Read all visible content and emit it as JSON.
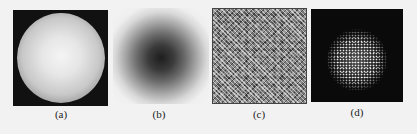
{
  "figure": {
    "panels": [
      {
        "id": "a",
        "label": "(a)",
        "description": "bright disc with radial falloff on dark square background"
      },
      {
        "id": "b",
        "label": "(b)",
        "description": "dark gaussian blob fading to white"
      },
      {
        "id": "c",
        "label": "(c)",
        "description": "uniform speckle noise texture"
      },
      {
        "id": "d",
        "label": "(d)",
        "description": "bright speckled circular cloud on black background"
      }
    ]
  }
}
